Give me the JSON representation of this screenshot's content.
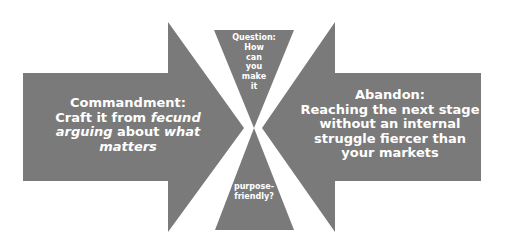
{
  "diagram": {
    "colors": {
      "shape_fill": "#7a7a7a",
      "text": "#ffffff",
      "background": "#ffffff"
    },
    "left_arrow": {
      "direction": "right",
      "label_title": "Commandment:",
      "line1_pre": "Craft it from ",
      "line1_em": "fecund",
      "line2_em": "arguing",
      "line2_mid": " about ",
      "line2_em2": "what",
      "line3_em": "matters"
    },
    "right_arrow": {
      "direction": "left",
      "label_title": "Abandon:",
      "lines": [
        "Reaching the next stage",
        "without an internal",
        "struggle fiercer than",
        "your markets"
      ]
    },
    "hourglass": {
      "top_lines": [
        "Question:",
        "How",
        "can",
        "you",
        "make",
        "it"
      ],
      "bottom_lines": [
        "purpose-",
        "friendly?"
      ]
    }
  }
}
